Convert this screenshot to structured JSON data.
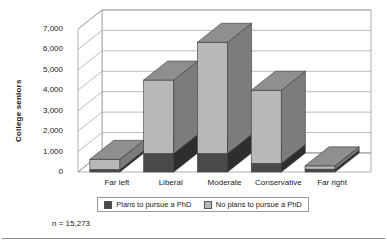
{
  "figure": {
    "note": "n = 15,273"
  },
  "legend": {
    "items": [
      {
        "label": "Plans to pursue a PhD",
        "color": "#4a4a4a",
        "key": "plans"
      },
      {
        "label": "No plans to pursue a PhD",
        "color": "#b8b8b8",
        "key": "no_plans"
      }
    ]
  },
  "chart_data": {
    "type": "bar",
    "subtype": "stacked-column-3d",
    "title": "",
    "xlabel": "",
    "ylabel": "College seniors",
    "ylim": [
      0,
      7000
    ],
    "ytick_values": [
      0,
      1000,
      2000,
      3000,
      4000,
      5000,
      6000,
      7000
    ],
    "ytick_labels": [
      "0",
      "1,000",
      "2,000",
      "3,000",
      "4,000",
      "5,000",
      "6,000",
      "7,000"
    ],
    "grid": true,
    "legend_position": "bottom",
    "categories": [
      "Far left",
      "Liberal",
      "Moderate",
      "Conservative",
      "Far right"
    ],
    "series": [
      {
        "name": "Plans to pursue a PhD",
        "color": "#4a4a4a",
        "values": [
          120,
          900,
          900,
          420,
          140
        ]
      },
      {
        "name": "No plans to pursue a PhD",
        "color": "#b8b8b8",
        "values": [
          500,
          3600,
          5450,
          3580,
          160
        ]
      }
    ],
    "totals": [
      620,
      4500,
      6350,
      4000,
      300
    ],
    "annotation": "n = 15,273"
  }
}
